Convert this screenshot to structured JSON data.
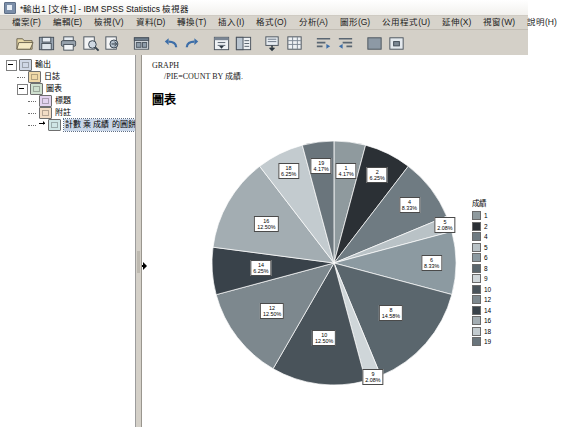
{
  "window": {
    "title": "*輸出1 [文件1] - IBM SPSS Statistics 檢視器",
    "app_icon": "spss-viewer-icon"
  },
  "menubar": {
    "items": [
      {
        "label": "檔案(F)"
      },
      {
        "label": "編輯(E)"
      },
      {
        "label": "檢視(V)"
      },
      {
        "label": "資料(D)"
      },
      {
        "label": "轉換(T)"
      },
      {
        "label": "插入(I)"
      },
      {
        "label": "格式(O)"
      },
      {
        "label": "分析(A)"
      },
      {
        "label": "圖形(G)"
      },
      {
        "label": "公用程式(U)"
      },
      {
        "label": "延伸(X)"
      },
      {
        "label": "視窗(W)"
      },
      {
        "label": "說明(H)"
      }
    ]
  },
  "toolbar": {
    "buttons": [
      {
        "name": "open-file-icon"
      },
      {
        "name": "save-icon"
      },
      {
        "name": "print-icon"
      },
      {
        "name": "print-preview-icon"
      },
      {
        "name": "export-icon"
      },
      {
        "name": "recall-dialog-icon"
      },
      {
        "name": "undo-icon"
      },
      {
        "name": "redo-icon"
      },
      {
        "name": "goto-case-icon"
      },
      {
        "name": "goto-variable-icon"
      },
      {
        "name": "insert-footnote-icon"
      },
      {
        "name": "insert-table-icon"
      },
      {
        "name": "promote-icon"
      },
      {
        "name": "demote-icon"
      },
      {
        "name": "collapse-icon"
      },
      {
        "name": "expand-icon"
      }
    ]
  },
  "outline": {
    "nodes": [
      {
        "label": "輸出",
        "icon": "output-icon",
        "level": 0,
        "expander": "minus"
      },
      {
        "label": "日誌",
        "icon": "log-icon",
        "level": 1,
        "expander": "none"
      },
      {
        "label": "圖表",
        "icon": "chart-icon",
        "level": 1,
        "expander": "minus"
      },
      {
        "label": "標題",
        "icon": "title-icon",
        "level": 2,
        "expander": "none"
      },
      {
        "label": "附註",
        "icon": "note-icon",
        "level": 2,
        "expander": "none"
      },
      {
        "label": "計數 乘 成績 的圓餅圖",
        "icon": "pie-icon",
        "level": 2,
        "expander": "none",
        "selected": true
      }
    ]
  },
  "output": {
    "syntax_line1": "GRAPH",
    "syntax_line2": "/PIE=COUNT BY 成績.",
    "section_title": "圖表"
  },
  "chart_data": {
    "type": "pie",
    "title": "圖表",
    "legend_title": "成績",
    "legend_position": "right",
    "value_label_format": "category + percent",
    "categories": [
      "1",
      "2",
      "4",
      "5",
      "6",
      "8",
      "9",
      "10",
      "12",
      "14",
      "16",
      "18",
      "19"
    ],
    "percents": [
      4.17,
      6.25,
      8.33,
      2.08,
      8.33,
      14.58,
      2.08,
      12.5,
      12.5,
      6.25,
      12.5,
      6.25,
      4.17
    ],
    "counts": [
      2,
      3,
      4,
      1,
      4,
      7,
      1,
      6,
      6,
      3,
      6,
      3,
      2
    ],
    "colors": [
      "#8f9a9e",
      "#2b3035",
      "#6f7b82",
      "#b9c2c6",
      "#8c9aa1",
      "#5a666d",
      "#cfd6d9",
      "#49535a",
      "#7d888e",
      "#39424a",
      "#a3adb2",
      "#c3cbcf",
      "#6a757c"
    ],
    "slice_labels": [
      {
        "category": "1",
        "percent": "4.17%"
      },
      {
        "category": "2",
        "percent": "6.25%"
      },
      {
        "category": "4",
        "percent": "8.33%"
      },
      {
        "category": "5",
        "percent": "2.08%"
      },
      {
        "category": "6",
        "percent": "8.33%"
      },
      {
        "category": "8",
        "percent": "14.58%"
      },
      {
        "category": "9",
        "percent": "2.08%"
      },
      {
        "category": "10",
        "percent": "12.50%"
      },
      {
        "category": "12",
        "percent": "12.50%"
      },
      {
        "category": "14",
        "percent": "6.25%"
      },
      {
        "category": "16",
        "percent": "12.50%"
      },
      {
        "category": "18",
        "percent": "6.25%"
      },
      {
        "category": "19",
        "percent": "4.17%"
      }
    ]
  }
}
